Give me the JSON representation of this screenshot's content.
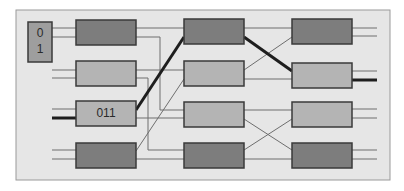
{
  "diagram": {
    "title": "",
    "colors": {
      "background": "#ffffff",
      "panel_fill": "#e6e6e6",
      "panel_stroke": "#9a9a9a",
      "box_dark": "#7d7d7d",
      "box_light": "#b4b4b4",
      "box_stroke": "#3a3a3a",
      "wire": "#6e6e6e",
      "wire_highlight": "#1e1e1e",
      "label_box": "#9e9e9e"
    },
    "panel": {
      "x": 16,
      "y": 10,
      "w": 374,
      "h": 170
    },
    "address_box": {
      "x": 28,
      "y": 22,
      "w": 24,
      "h": 40,
      "bit0": "0",
      "bit1": "1"
    },
    "switches": [
      {
        "id": "s1-1",
        "col": 1,
        "row": 1,
        "x": 76,
        "y": 20,
        "w": 60,
        "h": 25,
        "shade": "dark",
        "label": ""
      },
      {
        "id": "s1-2",
        "col": 1,
        "row": 2,
        "x": 76,
        "y": 61,
        "w": 60,
        "h": 25,
        "shade": "light",
        "label": ""
      },
      {
        "id": "s1-3",
        "col": 1,
        "row": 3,
        "x": 76,
        "y": 101,
        "w": 60,
        "h": 25,
        "shade": "light",
        "label": "011"
      },
      {
        "id": "s1-4",
        "col": 1,
        "row": 4,
        "x": 76,
        "y": 143,
        "w": 60,
        "h": 25,
        "shade": "dark",
        "label": ""
      },
      {
        "id": "s2-1",
        "col": 2,
        "row": 1,
        "x": 184,
        "y": 19,
        "w": 60,
        "h": 25,
        "shade": "dark",
        "label": ""
      },
      {
        "id": "s2-2",
        "col": 2,
        "row": 2,
        "x": 184,
        "y": 61,
        "w": 60,
        "h": 25,
        "shade": "light",
        "label": ""
      },
      {
        "id": "s2-3",
        "col": 2,
        "row": 3,
        "x": 184,
        "y": 102,
        "w": 60,
        "h": 25,
        "shade": "light",
        "label": ""
      },
      {
        "id": "s2-4",
        "col": 2,
        "row": 4,
        "x": 184,
        "y": 143,
        "w": 60,
        "h": 25,
        "shade": "dark",
        "label": ""
      },
      {
        "id": "s3-1",
        "col": 3,
        "row": 1,
        "x": 292,
        "y": 19,
        "w": 60,
        "h": 25,
        "shade": "dark",
        "label": ""
      },
      {
        "id": "s3-2",
        "col": 3,
        "row": 2,
        "x": 292,
        "y": 63,
        "w": 60,
        "h": 25,
        "shade": "light",
        "label": ""
      },
      {
        "id": "s3-3",
        "col": 3,
        "row": 3,
        "x": 292,
        "y": 102,
        "w": 60,
        "h": 25,
        "shade": "light",
        "label": ""
      },
      {
        "id": "s3-4",
        "col": 3,
        "row": 4,
        "x": 292,
        "y": 143,
        "w": 60,
        "h": 25,
        "shade": "dark",
        "label": ""
      }
    ],
    "wires": [
      {
        "points": [
          [
            52,
            28
          ],
          [
            76,
            28
          ]
        ],
        "highlight": false
      },
      {
        "points": [
          [
            52,
            37
          ],
          [
            76,
            37
          ]
        ],
        "highlight": false
      },
      {
        "points": [
          [
            52,
            70
          ],
          [
            76,
            70
          ]
        ],
        "highlight": false
      },
      {
        "points": [
          [
            52,
            78
          ],
          [
            76,
            78
          ]
        ],
        "highlight": false
      },
      {
        "points": [
          [
            52,
            109
          ],
          [
            76,
            109
          ]
        ],
        "highlight": false
      },
      {
        "points": [
          [
            52,
            118
          ],
          [
            76,
            118
          ]
        ],
        "highlight": true
      },
      {
        "points": [
          [
            52,
            150
          ],
          [
            76,
            150
          ]
        ],
        "highlight": false
      },
      {
        "points": [
          [
            52,
            159
          ],
          [
            76,
            159
          ]
        ],
        "highlight": false
      },
      {
        "points": [
          [
            136,
            28
          ],
          [
            184,
            28
          ]
        ],
        "highlight": false
      },
      {
        "points": [
          [
            136,
            37
          ],
          [
            160,
            37
          ],
          [
            160,
            110
          ],
          [
            184,
            110
          ]
        ],
        "highlight": false
      },
      {
        "points": [
          [
            136,
            70
          ],
          [
            184,
            70
          ]
        ],
        "highlight": false
      },
      {
        "points": [
          [
            136,
            78
          ],
          [
            148,
            78
          ],
          [
            148,
            150
          ],
          [
            184,
            150
          ]
        ],
        "highlight": false
      },
      {
        "points": [
          [
            136,
            110
          ],
          [
            184,
            37
          ]
        ],
        "highlight": true
      },
      {
        "points": [
          [
            136,
            118
          ],
          [
            184,
            118
          ]
        ],
        "highlight": false
      },
      {
        "points": [
          [
            136,
            151
          ],
          [
            184,
            79
          ]
        ],
        "highlight": false
      },
      {
        "points": [
          [
            136,
            159
          ],
          [
            184,
            159
          ]
        ],
        "highlight": false
      },
      {
        "points": [
          [
            244,
            28
          ],
          [
            292,
            28
          ]
        ],
        "highlight": false
      },
      {
        "points": [
          [
            244,
            37
          ],
          [
            292,
            71
          ]
        ],
        "highlight": true
      },
      {
        "points": [
          [
            244,
            70
          ],
          [
            292,
            37
          ]
        ],
        "highlight": false
      },
      {
        "points": [
          [
            244,
            79
          ],
          [
            292,
            79
          ]
        ],
        "highlight": false
      },
      {
        "points": [
          [
            244,
            110
          ],
          [
            292,
            110
          ]
        ],
        "highlight": false
      },
      {
        "points": [
          [
            244,
            119
          ],
          [
            292,
            150
          ]
        ],
        "highlight": false
      },
      {
        "points": [
          [
            244,
            150
          ],
          [
            292,
            119
          ]
        ],
        "highlight": false
      },
      {
        "points": [
          [
            244,
            159
          ],
          [
            292,
            159
          ]
        ],
        "highlight": false
      },
      {
        "points": [
          [
            352,
            28
          ],
          [
            377,
            28
          ]
        ],
        "highlight": false
      },
      {
        "points": [
          [
            352,
            36
          ],
          [
            377,
            36
          ]
        ],
        "highlight": false
      },
      {
        "points": [
          [
            352,
            71
          ],
          [
            377,
            71
          ]
        ],
        "highlight": false
      },
      {
        "points": [
          [
            352,
            80
          ],
          [
            377,
            80
          ]
        ],
        "highlight": true
      },
      {
        "points": [
          [
            352,
            109
          ],
          [
            377,
            109
          ]
        ],
        "highlight": false
      },
      {
        "points": [
          [
            352,
            118
          ],
          [
            377,
            118
          ]
        ],
        "highlight": false
      },
      {
        "points": [
          [
            352,
            150
          ],
          [
            377,
            150
          ]
        ],
        "highlight": false
      },
      {
        "points": [
          [
            352,
            159
          ],
          [
            377,
            159
          ]
        ],
        "highlight": false
      }
    ]
  }
}
